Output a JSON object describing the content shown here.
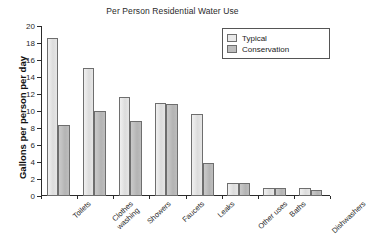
{
  "chart_data": {
    "type": "bar",
    "title": "Per Person Residential Water Use",
    "xlabel": "",
    "ylabel": "Gallons per person per day",
    "ylim": [
      0,
      20
    ],
    "ytick_step": 2,
    "yticks": [
      "0",
      "2",
      "4",
      "6",
      "8",
      "10",
      "12",
      "14",
      "16",
      "18",
      "20"
    ],
    "grid": false,
    "legend_position": "top-right",
    "categories": [
      "Toilets",
      "Clothes\nwashing",
      "Showers",
      "Faucets",
      "Leaks",
      "Other uses",
      "Baths",
      "Dishwashers"
    ],
    "series": [
      {
        "name": "Typical",
        "color": "#e9e9e9",
        "values": [
          18.6,
          15.1,
          11.6,
          10.9,
          9.6,
          1.5,
          1.0,
          1.0
        ]
      },
      {
        "name": "Conservation",
        "color": "#bdbdbd",
        "values": [
          8.3,
          10.0,
          8.8,
          10.8,
          3.9,
          1.5,
          1.0,
          0.7
        ]
      }
    ]
  }
}
